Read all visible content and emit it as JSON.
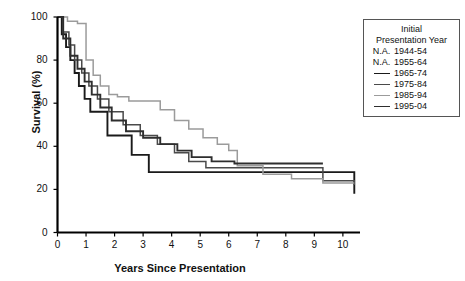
{
  "chart_data": {
    "type": "line",
    "title": "",
    "xlabel": "Years Since Presentation",
    "ylabel": "Survival (%)",
    "xlim": [
      0,
      10.6
    ],
    "ylim": [
      0,
      100
    ],
    "xticks": [
      0,
      1,
      2,
      3,
      4,
      5,
      6,
      7,
      8,
      9,
      10
    ],
    "yticks": [
      0,
      20,
      40,
      60,
      80,
      100
    ],
    "grid": false,
    "legend_position": "right-outside",
    "step_style": "post",
    "series": [
      {
        "name": "N.A. 1944-54",
        "legend_marker": "N.A.",
        "color": "#ffffff",
        "x": [],
        "y": []
      },
      {
        "name": "N.A. 1955-64",
        "legend_marker": "N.A.",
        "color": "#ffffff",
        "x": [],
        "y": []
      },
      {
        "name": "1965-74",
        "legend_marker": "line",
        "color": "#1a1a1a",
        "x": [
          0,
          0.15,
          0.3,
          0.45,
          0.6,
          0.75,
          0.95,
          1.15,
          1.45,
          1.75,
          2.1,
          2.6,
          3.2,
          4.3,
          10.4
        ],
        "y": [
          100,
          92,
          86,
          80,
          74,
          68,
          62,
          56,
          56,
          45,
          45,
          36,
          28,
          28,
          18
        ]
      },
      {
        "name": "1975-84",
        "legend_marker": "line",
        "color": "#4a4a4a",
        "x": [
          0,
          0.2,
          0.4,
          0.6,
          0.85,
          1.1,
          1.4,
          1.8,
          2.3,
          2.9,
          3.5,
          4.1,
          4.6,
          5.2,
          6.1,
          9.3,
          10.4
        ],
        "y": [
          100,
          93,
          87,
          80,
          74,
          68,
          62,
          56,
          50,
          45,
          41,
          37,
          33,
          30,
          30,
          24,
          22
        ]
      },
      {
        "name": "1985-94",
        "legend_marker": "line",
        "color": "#9b9b9b",
        "x": [
          0,
          0.35,
          0.7,
          1.0,
          1.25,
          1.5,
          1.8,
          2.1,
          2.5,
          2.9,
          3.3,
          3.6,
          4.1,
          4.6,
          5.1,
          5.6,
          6.0,
          6.3,
          7.2,
          8.2,
          9.3,
          10.4
        ],
        "y": [
          100,
          98,
          97,
          80,
          73,
          68,
          64,
          63,
          61,
          61,
          61,
          57,
          52,
          48,
          44,
          41,
          38,
          31,
          27,
          25,
          23,
          23
        ]
      },
      {
        "name": "1995-04",
        "legend_marker": "line",
        "color": "#2e2e2e",
        "x": [
          0,
          0.2,
          0.45,
          0.7,
          0.95,
          1.2,
          1.5,
          1.9,
          2.4,
          3.0,
          3.6,
          4.2,
          4.7,
          5.4,
          6.2,
          9.3
        ],
        "y": [
          100,
          90,
          82,
          76,
          70,
          64,
          58,
          52,
          47,
          44,
          41,
          38,
          35,
          33,
          32,
          32
        ]
      }
    ]
  },
  "legend": {
    "title_line1": "Initial",
    "title_line2": "Presentation Year",
    "entries": [
      {
        "marker_text": "N.A.",
        "label": "1944-54"
      },
      {
        "marker_text": "N.A.",
        "label": "1955-64"
      },
      {
        "marker_text": "",
        "label": "1965-74"
      },
      {
        "marker_text": "",
        "label": "1975-84"
      },
      {
        "marker_text": "",
        "label": "1985-94"
      },
      {
        "marker_text": "",
        "label": "1995-04"
      }
    ]
  },
  "axes": {
    "xtick_labels": [
      "0",
      "1",
      "2",
      "3",
      "4",
      "5",
      "6",
      "7",
      "8",
      "9",
      "10"
    ],
    "ytick_labels": [
      "0",
      "20",
      "40",
      "60",
      "80",
      "100"
    ],
    "xlabel": "Years Since Presentation",
    "ylabel": "Survival (%)"
  }
}
